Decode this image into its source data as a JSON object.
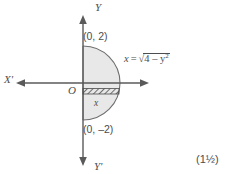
{
  "figure": {
    "type": "coordinate-geometry-diagram",
    "axes": {
      "y_positive_label": "Y",
      "y_negative_label": "Y'",
      "x_negative_label": "X'",
      "x_positive_label": "",
      "origin_label": "O",
      "axis_color": "#5a5a5a"
    },
    "points": [
      {
        "name": "top-intercept",
        "label": "(0, 2)",
        "coords": [
          0,
          2
        ]
      },
      {
        "name": "bottom-intercept",
        "label": "(0, –2)",
        "coords": [
          0,
          -2
        ]
      }
    ],
    "curve": {
      "equation_lhs": "x",
      "equation_eq": "=",
      "equation_radicand": "4 – y",
      "equation_exponent": "2",
      "equation_plain": "x = √(4 – y²)",
      "radius": 2,
      "fill_color": "#e8e8e8",
      "stroke_color": "#6e6e6e"
    },
    "strip": {
      "label": "x",
      "name": "elemental-strip",
      "hatch_color": "#4d4d4d"
    }
  },
  "footer": {
    "marks": "(1½)"
  }
}
